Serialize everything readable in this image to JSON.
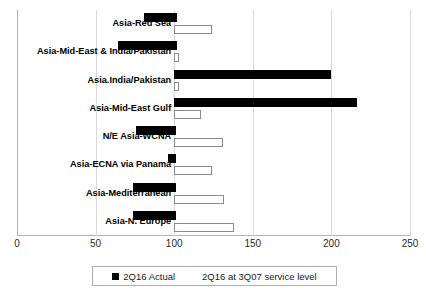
{
  "chart_data": {
    "type": "bar",
    "subtype": "floating-range-bar-horizontal",
    "title": "",
    "xlabel": "",
    "ylabel": "",
    "xlim": [
      0,
      250
    ],
    "xticks": [
      0,
      50,
      100,
      150,
      200,
      250
    ],
    "xticklabels": [
      "0",
      "50",
      "100",
      "150",
      "200",
      "250"
    ],
    "grid": true,
    "legend_position": "bottom",
    "categories": [
      "Asia-Red Sea",
      "Asia-Mid-East & India/Pakistan",
      "Asia.India/Pakistan",
      "Asia-Mid-East Gulf",
      "N/E Asia-WCNA",
      "Asia-ECNA via Panama",
      "Asia-Mediterranean",
      "Asia-N. Europe"
    ],
    "series": [
      {
        "name": "2Q16 Actual",
        "color": "#000000",
        "type": "floating-bar",
        "bars": [
          {
            "start": 81,
            "end": 102
          },
          {
            "start": 64,
            "end": 102
          },
          {
            "start": 100,
            "end": 200
          },
          {
            "start": 100,
            "end": 216
          },
          {
            "start": 76,
            "end": 101
          },
          {
            "start": 96,
            "end": 101
          },
          {
            "start": 74,
            "end": 101
          },
          {
            "start": 74,
            "end": 101
          }
        ]
      },
      {
        "name": "2Q16 at 3Q07 service level",
        "color": "#ffffff",
        "type": "floating-bar",
        "bars": [
          {
            "start": 100,
            "end": 124
          },
          {
            "start": 100,
            "end": 103
          },
          {
            "start": 100,
            "end": 103
          },
          {
            "start": 100,
            "end": 117
          },
          {
            "start": 100,
            "end": 131
          },
          {
            "start": 100,
            "end": 124
          },
          {
            "start": 100,
            "end": 132
          },
          {
            "start": 100,
            "end": 138
          }
        ]
      }
    ]
  },
  "legend": {
    "entries": [
      {
        "label": "2Q16 Actual",
        "swatch": "black-square"
      },
      {
        "label": "2Q16 at 3Q07 service level",
        "swatch": "white-square"
      }
    ]
  }
}
